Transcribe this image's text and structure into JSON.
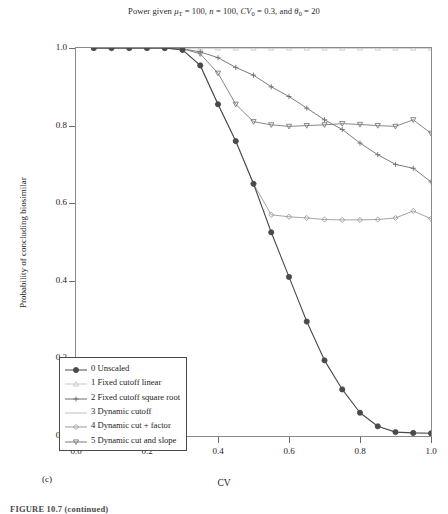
{
  "figure": {
    "title_prefix": "Power given ",
    "title_parts": [
      {
        "sym": "μ",
        "sub": "T",
        "val": " = 100, "
      },
      {
        "sym": "n",
        "sub": "",
        "val": " = 100, "
      },
      {
        "sym": "CV",
        "sub": "0",
        "val": " = 0.3, and "
      },
      {
        "sym": "θ",
        "sub": "0",
        "val": " = 20"
      }
    ],
    "panel_label": "(c)",
    "caption": "FIGURE 10.7 (continued)"
  },
  "axes": {
    "xlabel": "CV",
    "ylabel": "Probability of concluding biosimilar",
    "xticks": [
      "0.0",
      "0.2",
      "0.4",
      "0.6",
      "0.8",
      "1.0"
    ],
    "yticks": [
      "0.0",
      "0.2",
      "0.4",
      "0.6",
      "0.8",
      "1.0"
    ],
    "xlim": [
      0.0,
      1.0
    ],
    "ylim": [
      0.0,
      1.0
    ],
    "grid": false
  },
  "legend": {
    "position": "lower-left",
    "items": [
      {
        "label": "0 Unscaled",
        "marker": "circle",
        "color": "#4a4a4a"
      },
      {
        "label": "1 Fixed cutoff linear",
        "marker": "triangle-up",
        "color": "#c8c8c8"
      },
      {
        "label": "2 Fixed cutoff square root",
        "marker": "plus",
        "color": "#6e6e6e"
      },
      {
        "label": "3 Dynamic cutoff",
        "marker": "line",
        "color": "#bdbdbd"
      },
      {
        "label": "4 Dynamic cut + factor",
        "marker": "diamond",
        "color": "#9a9a9a"
      },
      {
        "label": "5 Dynamic cut and slope",
        "marker": "triangle-down",
        "color": "#7a7a7a"
      }
    ]
  },
  "chart_data": {
    "type": "line",
    "title": "Power given μT = 100, n = 100, CV0 = 0.3, and θ0 = 20",
    "xlabel": "CV",
    "ylabel": "Probability of concluding biosimilar",
    "xlim": [
      0.0,
      1.0
    ],
    "ylim": [
      0.0,
      1.0
    ],
    "grid": false,
    "x": [
      0.05,
      0.1,
      0.15,
      0.2,
      0.25,
      0.3,
      0.35,
      0.4,
      0.45,
      0.5,
      0.55,
      0.6,
      0.65,
      0.7,
      0.75,
      0.8,
      0.85,
      0.9,
      0.95,
      1.0
    ],
    "series": [
      {
        "name": "0 Unscaled",
        "marker": "circle",
        "color": "#4a4a4a",
        "values": [
          1.0,
          1.0,
          1.0,
          1.0,
          1.0,
          0.995,
          0.955,
          0.855,
          0.76,
          0.65,
          0.525,
          0.41,
          0.295,
          0.195,
          0.12,
          0.06,
          0.025,
          0.01,
          0.008,
          0.007
        ]
      },
      {
        "name": "1 Fixed cutoff linear",
        "marker": "triangle-up",
        "color": "#c8c8c8",
        "values": [
          1.0,
          1.0,
          1.0,
          1.0,
          1.0,
          1.0,
          1.0,
          1.0,
          1.0,
          1.0,
          1.0,
          1.0,
          1.0,
          1.0,
          1.0,
          1.0,
          1.0,
          1.0,
          1.0,
          1.0
        ]
      },
      {
        "name": "2 Fixed cutoff square root",
        "marker": "plus",
        "color": "#6e6e6e",
        "values": [
          1.0,
          1.0,
          1.0,
          1.0,
          1.0,
          0.998,
          0.99,
          0.975,
          0.95,
          0.93,
          0.9,
          0.875,
          0.845,
          0.815,
          0.79,
          0.755,
          0.725,
          0.7,
          0.69,
          0.655
        ]
      },
      {
        "name": "3 Dynamic cutoff",
        "marker": "line",
        "color": "#bdbdbd",
        "values": [
          1.0,
          1.0,
          1.0,
          1.0,
          1.0,
          1.0,
          1.0,
          1.0,
          1.0,
          1.0,
          1.0,
          1.0,
          1.0,
          1.0,
          1.0,
          1.0,
          1.0,
          1.0,
          1.0,
          1.0
        ]
      },
      {
        "name": "4 Dynamic cut + factor",
        "marker": "diamond",
        "color": "#9a9a9a",
        "values": [
          1.0,
          1.0,
          1.0,
          1.0,
          1.0,
          0.995,
          0.955,
          0.855,
          0.76,
          0.65,
          0.57,
          0.565,
          0.562,
          0.558,
          0.557,
          0.557,
          0.558,
          0.562,
          0.58,
          0.56
        ]
      },
      {
        "name": "5 Dynamic cut and slope",
        "marker": "triangle-down",
        "color": "#7a7a7a",
        "values": [
          1.0,
          1.0,
          1.0,
          1.0,
          1.0,
          0.998,
          0.985,
          0.935,
          0.855,
          0.81,
          0.802,
          0.798,
          0.8,
          0.802,
          0.805,
          0.803,
          0.8,
          0.798,
          0.815,
          0.78
        ]
      }
    ]
  }
}
